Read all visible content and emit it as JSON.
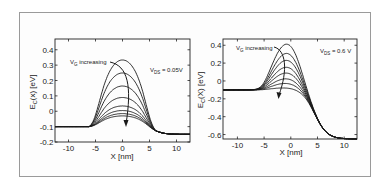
{
  "chart_data": [
    {
      "type": "line",
      "title": "",
      "xlabel": "X [nm]",
      "ylabel": "E_C(x) [eV]",
      "xlim": [
        -12.5,
        12.5
      ],
      "ylim": [
        -0.2,
        0.47
      ],
      "xticks": [
        -10,
        -5,
        0,
        5,
        10
      ],
      "yticks": [
        0.4,
        0.3,
        0.2,
        0.1,
        0,
        -0.1,
        -0.2
      ],
      "ytick_labels": [
        "0.4",
        "0.3",
        "0.2",
        "0.1",
        "0",
        "-0.1",
        "-0.2"
      ],
      "grid": false,
      "annotations": [
        {
          "text": "V_G increasing",
          "type": "arrow",
          "direction": "down, through curve peaks"
        },
        {
          "text": "V_DS = 0.05V",
          "position": "top-right"
        }
      ],
      "params": {
        "left_level": -0.1,
        "right_level": -0.15,
        "barrier_edges_nm": [
          -5,
          5
        ]
      },
      "series": [
        {
          "name": "V_G 1",
          "peak": 0.31
        },
        {
          "name": "V_G 2",
          "peak": 0.225
        },
        {
          "name": "V_G 3",
          "peak": 0.14
        },
        {
          "name": "V_G 4",
          "peak": 0.065
        },
        {
          "name": "V_G 5",
          "peak": 0.01
        },
        {
          "name": "V_G 6",
          "peak": -0.02
        },
        {
          "name": "V_G 7",
          "peak": -0.04
        },
        {
          "name": "V_G 8",
          "peak": -0.055
        }
      ]
    },
    {
      "type": "line",
      "title": "",
      "xlabel": "X [nm]",
      "ylabel": "E_C(X) [eV]",
      "xlim": [
        -12.7,
        12.4
      ],
      "ylim": [
        -0.65,
        0.47
      ],
      "xticks": [
        -10,
        -5,
        0,
        5,
        10
      ],
      "yticks": [
        0.4,
        0.2,
        0,
        -0.2,
        -0.4,
        -0.6
      ],
      "ytick_labels": [
        "0.4",
        "0.2",
        "0",
        "-0.2",
        "-0.4",
        "-0.6"
      ],
      "grid": false,
      "annotations": [
        {
          "text": "V_G increasing",
          "type": "arrow",
          "direction": "down, through curve peaks"
        },
        {
          "text": "V_DS = 0.6 V",
          "position": "top-right"
        }
      ],
      "params": {
        "left_level": -0.1,
        "right_level": -0.65
      },
      "series": [
        {
          "name": "V_G 1",
          "peak": 0.3
        },
        {
          "name": "V_G 2",
          "peak": 0.22
        },
        {
          "name": "V_G 3",
          "peak": 0.16
        },
        {
          "name": "V_G 4",
          "peak": 0.1
        },
        {
          "name": "V_G 5",
          "peak": 0.05
        },
        {
          "name": "V_G 6",
          "peak": 0.0
        },
        {
          "name": "V_G 7",
          "peak": -0.04
        },
        {
          "name": "V_G 8",
          "peak": -0.08
        }
      ]
    }
  ],
  "plots": [
    {
      "ylabel_main": "E",
      "ylabel_sub": "C",
      "ylabel_rest": "(x) [eV]",
      "xlabel": "X [nm]",
      "arrow_label_main": "V",
      "arrow_label_sub": "G",
      "arrow_label_rest": " increasing",
      "vds_main": "V",
      "vds_sub": "DS",
      "vds_rest": " = 0.05V"
    },
    {
      "ylabel_main": "E",
      "ylabel_sub": "C",
      "ylabel_rest": "(X) [eV]",
      "xlabel": "X [nm]",
      "arrow_label_main": "V",
      "arrow_label_sub": "G",
      "arrow_label_rest": " increasing",
      "vds_main": "V",
      "vds_sub": "DS",
      "vds_rest": " = 0.6 V"
    }
  ],
  "colors": {
    "line": "#1a1a1a",
    "frame": "#9a9a9a",
    "axes": "#222222"
  }
}
